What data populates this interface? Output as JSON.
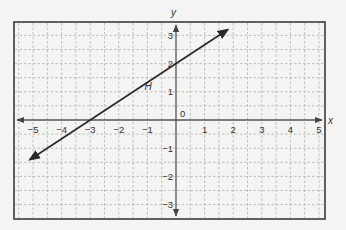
{
  "chart_data": {
    "type": "line",
    "title": "",
    "xlabel": "x",
    "ylabel": "y",
    "xlim": [
      -5.5,
      5.5
    ],
    "ylim": [
      -3.5,
      3.5
    ],
    "x_ticks": [
      -5,
      -4,
      -3,
      -2,
      -1,
      1,
      2,
      3,
      4,
      5
    ],
    "x_tick_labels": [
      "−5",
      "−4",
      "−3",
      "−2",
      "−1",
      "1",
      "2",
      "3",
      "4",
      "5"
    ],
    "y_ticks": [
      -3,
      -2,
      -1,
      1,
      2,
      3
    ],
    "y_tick_labels": [
      "−3",
      "−2",
      "−1",
      "1",
      "2",
      "3"
    ],
    "origin_label": "0",
    "grid": true,
    "grid_step": 0.5,
    "series": [
      {
        "name": "H",
        "equation": "y = (2/3)x + 2",
        "slope": 0.6667,
        "y_intercept": 2,
        "x_intercept": -3,
        "x": [
          -5.1,
          1.8
        ],
        "y": [
          -1.4,
          3.2
        ],
        "arrows": "both"
      }
    ],
    "annotations": [
      {
        "text": "H",
        "x": -1.1,
        "y": 1.05
      }
    ]
  },
  "colors": {
    "background": "#f4f4f2",
    "frame": "#3a3a3a",
    "grid": "#a8a8a8",
    "axis": "#555555",
    "line": "#2a2a2a",
    "text": "#333333"
  }
}
